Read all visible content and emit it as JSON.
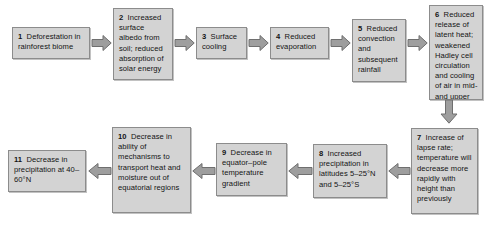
{
  "diagram": {
    "background_color": "#ffffff",
    "node_fill_color": "#d3d3d3",
    "node_border_color": "#8c8c8c",
    "arrow_fill_color": "#9e9e9e",
    "arrow_border_color": "#6f6f6f",
    "nodes": [
      {
        "id": "n1",
        "number": "1",
        "text": "Deforestation in rainforest biome"
      },
      {
        "id": "n2",
        "number": "2",
        "text": "Increased surface albedo from soil; reduced absorption of solar energy"
      },
      {
        "id": "n3",
        "number": "3",
        "text": "Surface cooling"
      },
      {
        "id": "n4",
        "number": "4",
        "text": "Reduced evaporation"
      },
      {
        "id": "n5",
        "number": "5",
        "text": "Reduced convection and subsequent rainfall"
      },
      {
        "id": "n6",
        "number": "6",
        "text": "Reduced release of latent heat; weakened Hadley cell circulation and cooling of air in mid- and upper atmosphere"
      },
      {
        "id": "n7",
        "number": "7",
        "text": "Increase of lapse rate; temperature will decrease more rapidly with height than previously"
      },
      {
        "id": "n8",
        "number": "8",
        "text": "Increased precipitation in latitudes 5–25°N and 5–25°S"
      },
      {
        "id": "n9",
        "number": "9",
        "text": "Decrease in equator–pole temperature gradient"
      },
      {
        "id": "n10",
        "number": "10",
        "text": "Decrease in ability of mechanisms to transport heat and moisture out of equatorial regions"
      },
      {
        "id": "n11",
        "number": "11",
        "text": "Decrease in precipitation at 40–60°N"
      }
    ],
    "connectors": [
      {
        "id": "a1",
        "from": "1",
        "to": "2",
        "direction": "right"
      },
      {
        "id": "a2",
        "from": "2",
        "to": "3",
        "direction": "right"
      },
      {
        "id": "a3",
        "from": "3",
        "to": "4",
        "direction": "right"
      },
      {
        "id": "a4",
        "from": "4",
        "to": "5",
        "direction": "right"
      },
      {
        "id": "a5",
        "from": "5",
        "to": "6",
        "direction": "right"
      },
      {
        "id": "a6",
        "from": "6",
        "to": "7",
        "direction": "down"
      },
      {
        "id": "a7",
        "from": "7",
        "to": "8",
        "direction": "left"
      },
      {
        "id": "a8",
        "from": "8",
        "to": "9",
        "direction": "left"
      },
      {
        "id": "a9",
        "from": "9",
        "to": "10",
        "direction": "left"
      },
      {
        "id": "a10",
        "from": "10",
        "to": "11",
        "direction": "left"
      }
    ]
  }
}
